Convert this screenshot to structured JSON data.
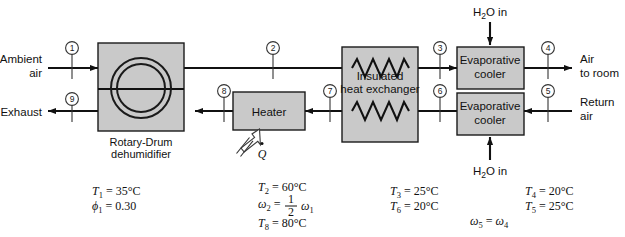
{
  "diagram": {
    "colors": {
      "box_fill": "#c9c9c9",
      "line": "#111111",
      "background": "#ffffff"
    }
  },
  "components": {
    "dehumidifier": {
      "label_line1": "Rotary-Drum",
      "label_line2": "dehumidifier"
    },
    "heater": {
      "label": "Heater",
      "heat_symbol": "Q"
    },
    "heat_exchanger": {
      "label_line1": "Insulated",
      "label_line2": "heat exchanger"
    },
    "evap_cooler_top": {
      "label_line1": "Evaporative",
      "label_line2": "cooler"
    },
    "evap_cooler_bottom": {
      "label_line1": "Evaporative",
      "label_line2": "cooler"
    }
  },
  "stream_labels": {
    "ambient_air_line1": "Ambient",
    "ambient_air_line2": "air",
    "exhaust": "Exhaust",
    "air_to_room_line1": "Air",
    "air_to_room_line2": "to room",
    "return_air_line1": "Return",
    "return_air_line2": "air",
    "water_in_top": "H2O in",
    "water_in_bottom": "H2O in"
  },
  "state_points": [
    {
      "id": "1",
      "x": 72,
      "y": 48
    },
    {
      "id": "2",
      "x": 273,
      "y": 48
    },
    {
      "id": "3",
      "x": 440,
      "y": 48
    },
    {
      "id": "4",
      "x": 548,
      "y": 48
    },
    {
      "id": "5",
      "x": 548,
      "y": 91
    },
    {
      "id": "6",
      "x": 440,
      "y": 91
    },
    {
      "id": "7",
      "x": 330,
      "y": 91
    },
    {
      "id": "8",
      "x": 224,
      "y": 91
    },
    {
      "id": "9",
      "x": 72,
      "y": 99
    }
  ],
  "annotations": {
    "block1": [
      {
        "sym": "T",
        "sub": "1",
        "val": "35°C"
      },
      {
        "sym": "ϕ",
        "sub": "1",
        "val": "0.30"
      }
    ],
    "block2": [
      {
        "sym": "T",
        "sub": "2",
        "val": "60°C"
      },
      {
        "sym": "ω",
        "sub": "2",
        "val": "fraction"
      },
      {
        "sym": "T",
        "sub": "8",
        "val": "80°C"
      }
    ],
    "block2_fraction": {
      "numerator": "1",
      "denominator": "2",
      "of": "ω",
      "of_sub": "1"
    },
    "block3": [
      {
        "sym": "T",
        "sub": "3",
        "val": "25°C"
      },
      {
        "sym": "T",
        "sub": "6",
        "val": "20°C"
      }
    ],
    "block4": [
      {
        "sym": "T",
        "sub": "4",
        "val": "20°C"
      },
      {
        "sym": "T",
        "sub": "5",
        "val": "25°C"
      }
    ],
    "block5": {
      "left_sym": "ω",
      "left_sub": "5",
      "eq": "=",
      "right_sym": "ω",
      "right_sub": "4"
    }
  }
}
